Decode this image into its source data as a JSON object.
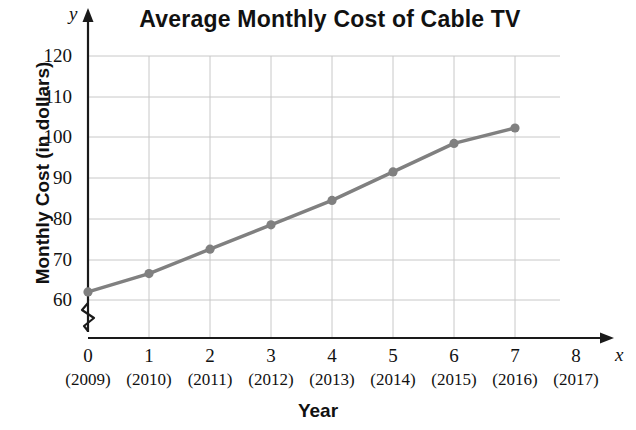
{
  "chart_data": {
    "type": "line",
    "title": "Average Monthly Cost of Cable TV",
    "xlabel": "Year",
    "ylabel": "Monthly Cost (in dollars)",
    "x_axis_letter": "x",
    "y_axis_letter": "y",
    "x": [
      0,
      1,
      2,
      3,
      4,
      5,
      6,
      7
    ],
    "values": [
      62,
      66.5,
      72.5,
      78.5,
      84.5,
      91.5,
      98.5,
      102.3
    ],
    "categories": [
      "(2009)",
      "(2010)",
      "(2011)",
      "(2012)",
      "(2013)",
      "(2014)",
      "(2015)",
      "(2016)"
    ],
    "x_tick_labels": [
      "0",
      "1",
      "2",
      "3",
      "4",
      "5",
      "6",
      "7",
      "8"
    ],
    "x_tick_sublabels": [
      "(2009)",
      "(2010)",
      "(2011)",
      "(2012)",
      "(2013)",
      "(2014)",
      "(2015)",
      "(2016)",
      "(2017)"
    ],
    "y_tick_labels": [
      "120",
      "110",
      "100",
      "90",
      "80",
      "70",
      "60"
    ],
    "y_tick_values": [
      120,
      110,
      100,
      90,
      80,
      70,
      60
    ],
    "xlim": [
      0,
      8
    ],
    "ylim": [
      60,
      120
    ],
    "grid": true,
    "legend": "none",
    "axis_break": "y-axis zigzag break below 60",
    "series_color": "#808080",
    "grid_color": "#c8c8c8",
    "axis_color": "#1a1a1a",
    "annotations": []
  },
  "labels": {
    "title": "Average Monthly Cost of Cable TV",
    "ylabel": "Monthly Cost (in dollars)",
    "xlabel": "Year",
    "x_letter": "x",
    "y_letter": "y"
  },
  "y_ticks": [
    {
      "label": "120",
      "y": 56
    },
    {
      "label": "110",
      "y": 97
    },
    {
      "label": "100",
      "y": 137
    },
    {
      "label": "90",
      "y": 178
    },
    {
      "label": "80",
      "y": 219
    },
    {
      "label": "70",
      "y": 260
    },
    {
      "label": "60",
      "y": 300
    }
  ],
  "x_ticks": [
    {
      "num": "0",
      "year": "(2009)",
      "x": 88
    },
    {
      "num": "1",
      "year": "(2010)",
      "x": 149
    },
    {
      "num": "2",
      "year": "(2011)",
      "x": 210
    },
    {
      "num": "3",
      "year": "(2012)",
      "x": 271
    },
    {
      "num": "4",
      "year": "(2013)",
      "x": 332
    },
    {
      "num": "5",
      "year": "(2014)",
      "x": 393
    },
    {
      "num": "6",
      "year": "(2015)",
      "x": 454
    },
    {
      "num": "7",
      "year": "(2016)",
      "x": 515
    },
    {
      "num": "8",
      "year": "(2017)",
      "x": 576
    }
  ]
}
